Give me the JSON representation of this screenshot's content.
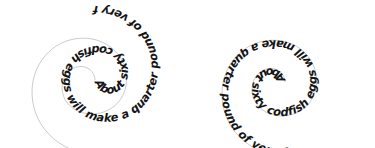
{
  "canvas": {
    "width": 375,
    "height": 148,
    "background_color": "#ffffff"
  },
  "text_color": "#141414",
  "guide_line_color": "#b4b4b4",
  "figures": [
    {
      "id": "spiral-left",
      "name": "spiral-text-left",
      "phrase": "About sixty codfish eggs will make a quarter pound of very fizzy jelly",
      "orientation": "rotated-180",
      "reading_direction": "inward-to-outward",
      "center_x": 95,
      "center_y": 80,
      "rotation_degrees": 180,
      "turns": 2.1
    },
    {
      "id": "spiral-right",
      "name": "spiral-text-right",
      "phrase": "About sixty codfish eggs will make a quarter pound of very fizzy jelly",
      "orientation": "upright",
      "reading_direction": "inward-to-outward",
      "center_x": 98,
      "center_y": 82,
      "rotation_degrees": 0,
      "turns": 2.1
    }
  ]
}
